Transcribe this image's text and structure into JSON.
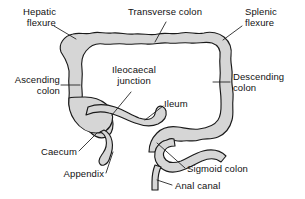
{
  "diagram": {
    "background_color": "#ffffff",
    "organ_fill_color": "#d6d6d6",
    "organ_outline_color": "#1a1a1a",
    "lumen_fill_color": "#ffffff",
    "leader_line_color": "#1a1a1a"
  },
  "labels": {
    "hepatic_flexure": "Hepatic\nflexure",
    "transverse_colon": "Transverse colon",
    "splenic_flexure": "Splenic\nflexure",
    "ascending_colon": "Ascending\ncolon",
    "descending_colon": "Descending\ncolon",
    "ileocaecal_junction": "Ileocaecal\njunction",
    "ileum": "Ileum",
    "caecum": "Caecum",
    "appendix": "Appendix",
    "sigmoid_colon": "Sigmoid colon",
    "anal_canal": "Anal canal"
  }
}
